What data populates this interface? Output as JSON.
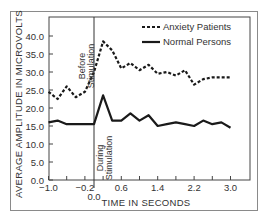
{
  "chart_data": {
    "type": "line",
    "title": "",
    "xlabel": "TIME IN SECONDS",
    "ylabel": "AVERAGE AMPLITUDE IN MICROVOLTS",
    "xlim": [
      -1.0,
      3.2
    ],
    "ylim": [
      0.0,
      45.0
    ],
    "x_ticks": [
      -1.0,
      -0.2,
      0.0,
      0.6,
      1.4,
      2.2,
      3.0
    ],
    "x_tick_labels": [
      "−1.0",
      "−0.2",
      "0.0",
      "0.6",
      "1.4",
      "2.2",
      "3.0"
    ],
    "y_ticks": [
      0,
      5,
      10,
      15,
      20,
      25,
      30,
      35,
      40
    ],
    "y_tick_labels": [
      "0.0",
      "5.0",
      "10.0",
      "15.0",
      "20.0",
      "25.0",
      "30.0",
      "35.0",
      "40.0"
    ],
    "grid": false,
    "legend_position": "upper right",
    "annotations": [
      {
        "text": "Before Stimulation",
        "x": -0.05,
        "orientation": "vertical"
      },
      {
        "text": "During Stimulation",
        "x": 0.05,
        "orientation": "vertical"
      }
    ],
    "stimulus_line_x": 0.0,
    "x": [
      -1.0,
      -0.8,
      -0.6,
      -0.4,
      -0.2,
      0.0,
      0.2,
      0.4,
      0.6,
      0.8,
      1.0,
      1.2,
      1.4,
      1.6,
      1.8,
      2.0,
      2.2,
      2.4,
      2.6,
      2.8,
      3.0
    ],
    "series": [
      {
        "name": "Anxiety Patients",
        "style": "dashed",
        "values": [
          24.5,
          22.5,
          26.0,
          23.0,
          24.5,
          30.0,
          38.5,
          36.0,
          31.0,
          32.5,
          30.5,
          32.0,
          29.5,
          30.0,
          29.0,
          30.5,
          26.5,
          28.0,
          28.5,
          28.5,
          28.5
        ]
      },
      {
        "name": "Normal Persons",
        "style": "solid",
        "values": [
          16.0,
          16.5,
          15.5,
          15.5,
          15.5,
          15.5,
          23.5,
          16.5,
          16.5,
          18.5,
          16.5,
          18.0,
          15.0,
          15.5,
          16.0,
          15.5,
          15.0,
          16.5,
          15.5,
          16.0,
          14.5
        ]
      }
    ]
  },
  "legend": {
    "items": [
      {
        "label": "Anxiety Patients",
        "style": "dashed"
      },
      {
        "label": "Normal Persons",
        "style": "solid"
      }
    ]
  },
  "colors": {
    "line": "#1a1a1a",
    "frame": "#8a8a8a",
    "text": "#333333"
  }
}
